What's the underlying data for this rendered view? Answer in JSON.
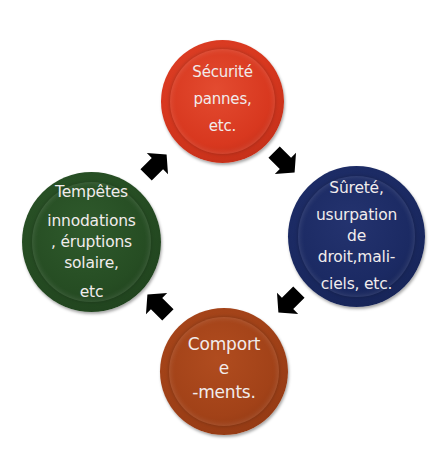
{
  "diagram": {
    "type": "cycle",
    "direction": "clockwise",
    "nodes": [
      {
        "id": "top",
        "color": "#d8381f",
        "lines": [
          "Sécurité",
          "pannes,",
          "etc."
        ]
      },
      {
        "id": "right",
        "color": "#1b2a63",
        "lines": [
          "Sûreté,",
          "usurpation",
          "de",
          "droit,mali-",
          "ciels, etc."
        ]
      },
      {
        "id": "bottom",
        "color": "#a24218",
        "lines": [
          "Comport",
          "e",
          "-ments."
        ]
      },
      {
        "id": "left",
        "color": "#264d23",
        "lines": [
          "Tempêtes",
          "innodations",
          ", éruptions",
          "solaire,",
          "etc"
        ]
      }
    ],
    "arrows": [
      {
        "from": "left",
        "to": "top",
        "icon": "arrow-up-right-icon"
      },
      {
        "from": "top",
        "to": "right",
        "icon": "arrow-down-right-icon"
      },
      {
        "from": "right",
        "to": "bottom",
        "icon": "arrow-down-left-icon"
      },
      {
        "from": "bottom",
        "to": "left",
        "icon": "arrow-up-left-icon"
      }
    ],
    "arrow_color": "#000000",
    "background": "#ffffff"
  }
}
